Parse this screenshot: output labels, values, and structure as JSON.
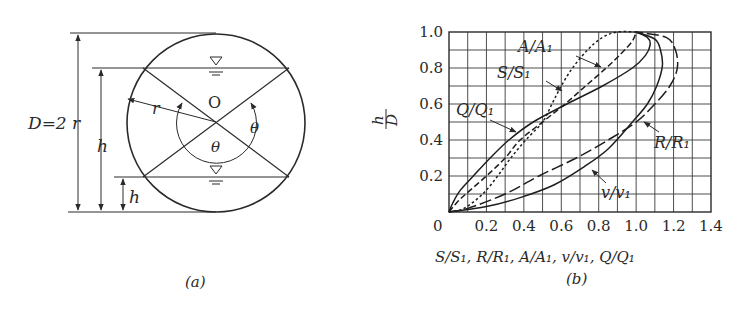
{
  "figure_a": {
    "caption": "(a)",
    "diameter_label": "D=2 r",
    "radius_label": "r",
    "center_label": "O",
    "angle_label": "θ",
    "depth_label": "h",
    "water_surface_symbol": "▽"
  },
  "figure_b": {
    "caption": "(b)",
    "ylabel_num": "h",
    "ylabel_den": "D",
    "xlabel": "S/S₁, R/R₁, A/A₁, v/v₁, Q/Q₁",
    "origin_label": "0",
    "x_ticks": [
      "0.2",
      "0.4",
      "0.6",
      "0.8",
      "1.0",
      "1.2",
      "1.4"
    ],
    "y_ticks": [
      "0.2",
      "0.4",
      "0.6",
      "0.8",
      "1.0"
    ],
    "curve_labels": {
      "A": "A/A₁",
      "S": "S/S₁",
      "Q": "Q/Q₁",
      "R": "R/R₁",
      "v": "v/v₁"
    }
  },
  "chart_data": {
    "type": "line",
    "title": "",
    "xlabel": "S/S1, R/R1, A/A1, v/v1, Q/Q1",
    "ylabel": "h/D",
    "xlim": [
      0,
      1.4
    ],
    "ylim": [
      0,
      1.0
    ],
    "grid": true,
    "x_ticks": [
      0,
      0.2,
      0.4,
      0.6,
      0.8,
      1.0,
      1.2,
      1.4
    ],
    "y_ticks": [
      0,
      0.2,
      0.4,
      0.6,
      0.8,
      1.0
    ],
    "series": [
      {
        "name": "Q/Q1",
        "style": "solid",
        "points": [
          [
            0,
            0
          ],
          [
            0.02,
            0.05
          ],
          [
            0.06,
            0.12
          ],
          [
            0.13,
            0.2
          ],
          [
            0.22,
            0.3
          ],
          [
            0.32,
            0.4
          ],
          [
            0.45,
            0.5
          ],
          [
            0.63,
            0.6
          ],
          [
            0.82,
            0.7
          ],
          [
            0.98,
            0.8
          ],
          [
            1.05,
            0.87
          ],
          [
            1.075,
            0.93
          ],
          [
            1.06,
            0.97
          ],
          [
            1.0,
            1.0
          ]
        ]
      },
      {
        "name": "A/A1",
        "style": "dashed",
        "points": [
          [
            0,
            0
          ],
          [
            0.04,
            0.05
          ],
          [
            0.09,
            0.1
          ],
          [
            0.2,
            0.2
          ],
          [
            0.3,
            0.3
          ],
          [
            0.38,
            0.4
          ],
          [
            0.5,
            0.5
          ],
          [
            0.62,
            0.6
          ],
          [
            0.73,
            0.7
          ],
          [
            0.84,
            0.8
          ],
          [
            0.92,
            0.88
          ],
          [
            0.98,
            0.95
          ],
          [
            1.0,
            1.0
          ]
        ]
      },
      {
        "name": "S/S1",
        "style": "dotted",
        "points": [
          [
            0,
            0
          ],
          [
            0.08,
            0.02
          ],
          [
            0.18,
            0.1
          ],
          [
            0.26,
            0.2
          ],
          [
            0.33,
            0.3
          ],
          [
            0.41,
            0.4
          ],
          [
            0.5,
            0.5
          ],
          [
            0.55,
            0.6
          ],
          [
            0.6,
            0.7
          ],
          [
            0.66,
            0.8
          ],
          [
            0.74,
            0.9
          ],
          [
            0.82,
            0.97
          ],
          [
            0.9,
            1.0
          ],
          [
            1.0,
            1.0
          ]
        ]
      },
      {
        "name": "v/v1",
        "style": "solid",
        "points": [
          [
            0,
            0
          ],
          [
            0.2,
            0.03
          ],
          [
            0.38,
            0.08
          ],
          [
            0.56,
            0.15
          ],
          [
            0.72,
            0.25
          ],
          [
            0.85,
            0.35
          ],
          [
            0.98,
            0.5
          ],
          [
            1.06,
            0.6
          ],
          [
            1.11,
            0.7
          ],
          [
            1.14,
            0.81
          ],
          [
            1.13,
            0.9
          ],
          [
            1.1,
            0.96
          ],
          [
            1.0,
            1.0
          ]
        ]
      },
      {
        "name": "R/R1",
        "style": "longdash",
        "points": [
          [
            0,
            0
          ],
          [
            0.1,
            0.02
          ],
          [
            0.3,
            0.1
          ],
          [
            0.48,
            0.2
          ],
          [
            0.68,
            0.3
          ],
          [
            0.85,
            0.4
          ],
          [
            1.0,
            0.5
          ],
          [
            1.1,
            0.6
          ],
          [
            1.18,
            0.7
          ],
          [
            1.22,
            0.8
          ],
          [
            1.21,
            0.9
          ],
          [
            1.16,
            0.97
          ],
          [
            1.0,
            1.0
          ]
        ]
      }
    ]
  }
}
